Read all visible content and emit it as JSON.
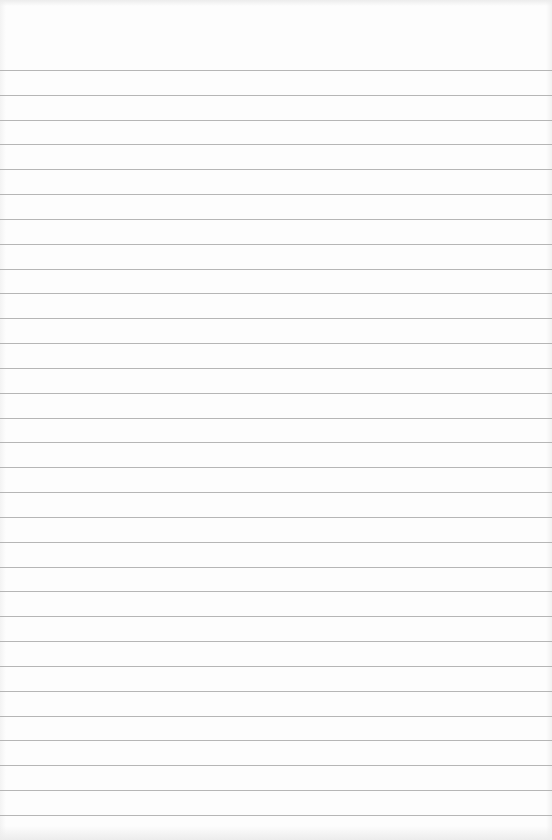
{
  "page": {
    "type": "lined-notepad-paper",
    "background_color": "#fdfdfd",
    "rule_color": "#a9a9a9",
    "rule_count": 31,
    "first_rule_y": 70,
    "rule_spacing_px": 24.83,
    "text_content": ""
  }
}
